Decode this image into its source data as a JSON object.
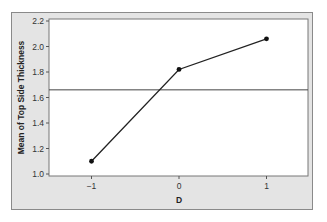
{
  "chart_data": {
    "type": "line",
    "title": "",
    "xlabel": "D",
    "ylabel": "Mean of Top Side Thickness",
    "categories": [
      "-1",
      "0",
      "1"
    ],
    "x": [
      -1,
      0,
      1
    ],
    "series": [
      {
        "name": "Mean of Top Side Thickness",
        "values": [
          1.1,
          1.82,
          2.06
        ]
      }
    ],
    "reference_line": {
      "orientation": "horizontal",
      "y": 1.66,
      "label": "overall mean"
    },
    "xlim": [
      -1.5,
      1.4
    ],
    "ylim": [
      1.0,
      2.2
    ],
    "yticks": [
      1.0,
      1.2,
      1.4,
      1.6,
      1.8,
      2.0,
      2.2
    ],
    "ytick_labels": [
      "1.0",
      "1.2",
      "1.4",
      "1.6",
      "1.8",
      "2.0",
      "2.2"
    ],
    "xticks": [
      -1,
      0,
      1
    ],
    "xtick_labels": [
      "−1",
      "0",
      "1"
    ],
    "grid": false,
    "legend": null
  },
  "colors": {
    "frame_background": "#e4e4e4",
    "plot_background": "#ffffff",
    "line": "#222222",
    "reference_line": "#444444",
    "border": "#8a8a8a"
  }
}
